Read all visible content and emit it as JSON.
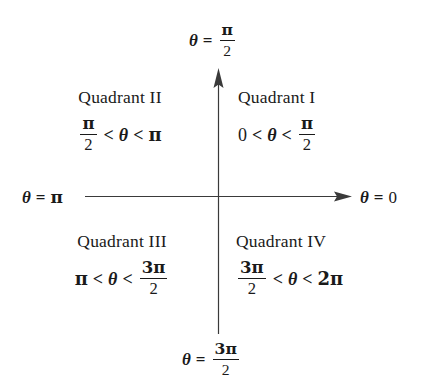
{
  "diagram": {
    "type": "quadrant-angle-reference",
    "background_color": "#ffffff",
    "axis_color": "#3a3a3a"
  },
  "axis_labels": {
    "top": {
      "name": "theta-equals-pi-over-two",
      "theta": "θ",
      "equals": "=",
      "numerator": "π",
      "denominator": "2",
      "plain": "θ = π/2"
    },
    "left": {
      "name": "theta-equals-pi",
      "theta": "θ",
      "equals": "=",
      "value": "π",
      "plain": "θ = π"
    },
    "right": {
      "name": "theta-equals-zero",
      "theta": "θ",
      "equals": "=",
      "value": "0",
      "plain": "θ = 0"
    },
    "bottom": {
      "name": "theta-equals-three-pi-over-two",
      "theta": "θ",
      "equals": "=",
      "numerator": "3π",
      "denominator": "2",
      "plain": "θ = 3π/2"
    }
  },
  "quadrants": [
    {
      "id": "quadrant-1",
      "title": "Quadrant I",
      "inequality_plain": "0 < θ < π/2",
      "left_term": "0",
      "left_op": "<",
      "variable": "θ",
      "right_op": "<",
      "right_term_numerator": "π",
      "right_term_denominator": "2",
      "range_start_radians": 0,
      "range_end_radians": 1.5708
    },
    {
      "id": "quadrant-2",
      "title": "Quadrant II",
      "inequality_plain": "π/2 < θ < π",
      "left_term_numerator": "π",
      "left_term_denominator": "2",
      "left_op": "<",
      "variable": "θ",
      "right_op": "<",
      "right_term": "π",
      "range_start_radians": 1.5708,
      "range_end_radians": 3.1416
    },
    {
      "id": "quadrant-3",
      "title": "Quadrant III",
      "inequality_plain": "π < θ < 3π/2",
      "left_term": "π",
      "left_op": "<",
      "variable": "θ",
      "right_op": "<",
      "right_term_numerator": "3π",
      "right_term_denominator": "2",
      "range_start_radians": 3.1416,
      "range_end_radians": 4.7124
    },
    {
      "id": "quadrant-4",
      "title": "Quadrant IV",
      "inequality_plain": "3π/2 < θ < 2π",
      "left_term_numerator": "3π",
      "left_term_denominator": "2",
      "left_op": "<",
      "variable": "θ",
      "right_op": "<",
      "right_term": "2π",
      "range_start_radians": 4.7124,
      "range_end_radians": 6.2832
    }
  ]
}
